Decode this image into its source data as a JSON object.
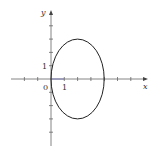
{
  "figure": {
    "axis_labels": {
      "x": "x",
      "y": "y"
    },
    "tick_labels": {
      "origin": "0",
      "x_one": "1",
      "y_one": "1"
    },
    "curve": {
      "type": "ellipse",
      "center": [
        2,
        0
      ],
      "semi_x": 2,
      "semi_y": 3
    },
    "colors": {
      "axis": "#555555",
      "curve": "#222222",
      "axis_segment": "#6a6ab0"
    }
  }
}
